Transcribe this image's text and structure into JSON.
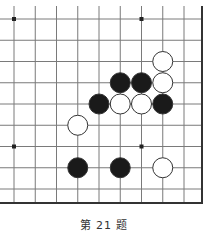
{
  "diagram": {
    "type": "go-problem",
    "caption": "第 21 题",
    "grid": {
      "x0": 14,
      "y0": 19,
      "spacing": 21.25,
      "cols": 9,
      "rows": 9,
      "right_edge_x": 202,
      "bottom_edge_y": 203,
      "line_color": "#7a7a7a",
      "edge_color": "#333333"
    },
    "star_points": [
      {
        "col": 0,
        "row": 0
      },
      {
        "col": 6,
        "row": 0
      },
      {
        "col": 0,
        "row": 6
      },
      {
        "col": 6,
        "row": 6
      }
    ],
    "stones": [
      {
        "color": "white",
        "col": 7,
        "row": 2
      },
      {
        "color": "black",
        "col": 5,
        "row": 3
      },
      {
        "color": "black",
        "col": 6,
        "row": 3
      },
      {
        "color": "white",
        "col": 7,
        "row": 3
      },
      {
        "color": "black",
        "col": 4,
        "row": 4
      },
      {
        "color": "white",
        "col": 5,
        "row": 4
      },
      {
        "color": "white",
        "col": 6,
        "row": 4
      },
      {
        "color": "black",
        "col": 7,
        "row": 4
      },
      {
        "color": "white",
        "col": 3,
        "row": 5
      },
      {
        "color": "black",
        "col": 3,
        "row": 7
      },
      {
        "color": "black",
        "col": 5,
        "row": 7
      },
      {
        "color": "white",
        "col": 7,
        "row": 7
      }
    ],
    "colors": {
      "black_stone": "#1a1a1a",
      "white_stone": "#ffffff",
      "stone_outline": "#333333"
    }
  }
}
